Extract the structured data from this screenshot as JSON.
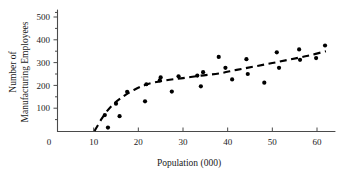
{
  "chart_data": {
    "type": "scatter",
    "title": "",
    "xlabel": "Population (000)",
    "ylabel": "Number of Manufacturing Employees",
    "ylabel_line1": "Number of",
    "ylabel_line2": "Manufacturing Employees",
    "xlim": [
      0,
      64
    ],
    "ylim": [
      0,
      530
    ],
    "xticks": [
      0,
      10,
      20,
      30,
      40,
      50,
      60
    ],
    "xtick_labels": [
      "0",
      "10",
      "20",
      "30",
      "40",
      "50",
      "60"
    ],
    "yticks": [
      100,
      200,
      300,
      400,
      500
    ],
    "ytick_labels": [
      "100",
      "200",
      "300",
      "400",
      "500"
    ],
    "yminor_ticks": [
      50,
      150,
      250,
      350,
      450,
      520
    ],
    "grid": false,
    "legend": false,
    "marker": "filled-circle",
    "marker_color": "#000000",
    "trend_style": "dashed",
    "trend_color": "#000000",
    "points": [
      {
        "x": 12.5,
        "y": 70
      },
      {
        "x": 13.2,
        "y": 15
      },
      {
        "x": 15.0,
        "y": 120
      },
      {
        "x": 15.8,
        "y": 65
      },
      {
        "x": 17.5,
        "y": 172
      },
      {
        "x": 21.5,
        "y": 130
      },
      {
        "x": 21.8,
        "y": 205
      },
      {
        "x": 24.8,
        "y": 222
      },
      {
        "x": 25.0,
        "y": 235
      },
      {
        "x": 27.5,
        "y": 173
      },
      {
        "x": 29.0,
        "y": 240
      },
      {
        "x": 33.2,
        "y": 243
      },
      {
        "x": 34.0,
        "y": 196
      },
      {
        "x": 34.5,
        "y": 258
      },
      {
        "x": 38.0,
        "y": 325
      },
      {
        "x": 39.5,
        "y": 277
      },
      {
        "x": 41.0,
        "y": 226
      },
      {
        "x": 44.2,
        "y": 315
      },
      {
        "x": 44.5,
        "y": 250
      },
      {
        "x": 48.2,
        "y": 212
      },
      {
        "x": 51.0,
        "y": 345
      },
      {
        "x": 51.5,
        "y": 277
      },
      {
        "x": 56.0,
        "y": 358
      },
      {
        "x": 56.2,
        "y": 312
      },
      {
        "x": 59.8,
        "y": 320
      },
      {
        "x": 61.8,
        "y": 375
      }
    ],
    "trend_points": [
      {
        "x": 10.2,
        "y": 0
      },
      {
        "x": 12.0,
        "y": 60
      },
      {
        "x": 14.0,
        "y": 110
      },
      {
        "x": 16.5,
        "y": 150
      },
      {
        "x": 19.0,
        "y": 180
      },
      {
        "x": 22.0,
        "y": 205
      },
      {
        "x": 26.0,
        "y": 222
      },
      {
        "x": 30.0,
        "y": 232
      },
      {
        "x": 34.0,
        "y": 243
      },
      {
        "x": 38.0,
        "y": 252
      },
      {
        "x": 42.0,
        "y": 268
      },
      {
        "x": 46.0,
        "y": 283
      },
      {
        "x": 50.0,
        "y": 298
      },
      {
        "x": 54.0,
        "y": 314
      },
      {
        "x": 58.0,
        "y": 330
      },
      {
        "x": 62.0,
        "y": 350
      }
    ]
  }
}
